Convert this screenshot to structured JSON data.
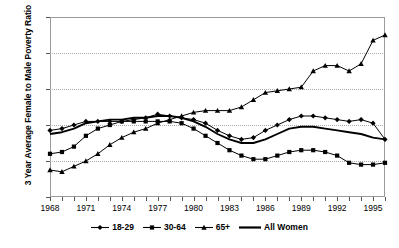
{
  "chart_data": {
    "type": "line",
    "title": "",
    "xlabel": "",
    "ylabel": "3 Year Average Female to Male Poverty Ratio",
    "ylim": [
      1.2,
      2.2
    ],
    "ytick_labels": [
      "1.2",
      "1.4",
      "1.6",
      "1.8",
      "2",
      "2.2"
    ],
    "ytick_values": [
      1.2,
      1.4,
      1.6,
      1.8,
      2.0,
      2.2
    ],
    "xlim": [
      1968,
      1996
    ],
    "xtick_labels": [
      "1968",
      "1971",
      "1974",
      "1977",
      "1980",
      "1983",
      "1986",
      "1989",
      "1992",
      "1995"
    ],
    "xtick_values": [
      1968,
      1971,
      1974,
      1977,
      1980,
      1983,
      1986,
      1989,
      1992,
      1995
    ],
    "grid": "horizontal-dotted",
    "legend_position": "bottom",
    "x": [
      1968,
      1969,
      1970,
      1971,
      1972,
      1973,
      1974,
      1975,
      1976,
      1977,
      1978,
      1979,
      1980,
      1981,
      1982,
      1983,
      1984,
      1985,
      1986,
      1987,
      1988,
      1989,
      1990,
      1991,
      1992,
      1993,
      1994,
      1995,
      1996
    ],
    "series": [
      {
        "name": "18-29",
        "marker": "diamond",
        "values": [
          1.57,
          1.58,
          1.6,
          1.62,
          1.62,
          1.62,
          1.62,
          1.63,
          1.64,
          1.66,
          1.65,
          1.64,
          1.63,
          1.61,
          1.57,
          1.54,
          1.52,
          1.53,
          1.57,
          1.6,
          1.63,
          1.65,
          1.65,
          1.64,
          1.63,
          1.62,
          1.63,
          1.61,
          1.52
        ]
      },
      {
        "name": "30-64",
        "marker": "square",
        "values": [
          1.44,
          1.45,
          1.48,
          1.54,
          1.58,
          1.6,
          1.62,
          1.62,
          1.62,
          1.62,
          1.62,
          1.61,
          1.58,
          1.54,
          1.5,
          1.46,
          1.43,
          1.41,
          1.41,
          1.43,
          1.45,
          1.46,
          1.46,
          1.45,
          1.43,
          1.39,
          1.38,
          1.38,
          1.39
        ]
      },
      {
        "name": "65+",
        "marker": "triangle",
        "values": [
          1.35,
          1.34,
          1.37,
          1.4,
          1.44,
          1.49,
          1.53,
          1.56,
          1.58,
          1.61,
          1.63,
          1.65,
          1.67,
          1.68,
          1.68,
          1.68,
          1.7,
          1.74,
          1.78,
          1.79,
          1.8,
          1.81,
          1.9,
          1.93,
          1.93,
          1.9,
          1.94,
          2.07,
          2.1
        ]
      },
      {
        "name": "All Women",
        "marker": "none",
        "values": [
          1.55,
          1.56,
          1.58,
          1.61,
          1.62,
          1.63,
          1.63,
          1.64,
          1.64,
          1.65,
          1.65,
          1.64,
          1.62,
          1.59,
          1.55,
          1.52,
          1.5,
          1.5,
          1.52,
          1.55,
          1.58,
          1.59,
          1.59,
          1.58,
          1.57,
          1.56,
          1.55,
          1.53,
          1.52
        ]
      }
    ]
  },
  "legend": {
    "items": [
      {
        "label": "18-29",
        "marker": "diamond"
      },
      {
        "label": "30-64",
        "marker": "square"
      },
      {
        "label": "65+",
        "marker": "triangle"
      },
      {
        "label": "All Women",
        "marker": "none"
      }
    ]
  },
  "colors": {
    "series": "#000000",
    "grid": "#aaaaaa",
    "axis": "#8f8f8f",
    "background": "#ffffff"
  }
}
